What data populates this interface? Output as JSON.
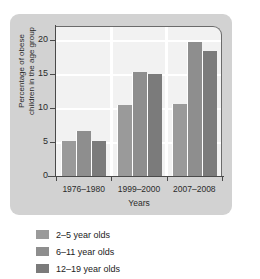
{
  "chart_data": {
    "type": "bar",
    "title": "",
    "xlabel": "Years",
    "ylabel_line1": "Percentage of obese",
    "ylabel_line2": "children in the age group",
    "categories": [
      "1976–1980",
      "1999–2000",
      "2007–2008"
    ],
    "series": [
      {
        "name": "2–5 year olds",
        "values": [
          5.1,
          10.4,
          10.6
        ],
        "color": "#9a9a9a"
      },
      {
        "name": "6–11 year olds",
        "values": [
          6.6,
          15.3,
          19.6
        ],
        "color": "#8e8e8e"
      },
      {
        "name": "12–19 year olds",
        "values": [
          5.1,
          15.0,
          18.4
        ],
        "color": "#7b7b7b"
      }
    ],
    "ylim": [
      0,
      22
    ],
    "yticks": [
      0,
      5,
      10,
      15,
      20
    ],
    "ytick_labels": [
      "0",
      "5",
      "10",
      "15",
      "20"
    ],
    "grid": "horizontal",
    "legend_position": "below"
  },
  "legend": {
    "items": [
      {
        "label": "2–5 year olds",
        "color": "#9a9a9a"
      },
      {
        "label": "6–11 year olds",
        "color": "#8e8e8e"
      },
      {
        "label": "12–19 year olds",
        "color": "#7b7b7b"
      }
    ]
  },
  "colors": {
    "panel": "#d2d2d2",
    "plot_background": "#f2f2f2",
    "gridline": "#ffffff",
    "axis": "#4a4a4a",
    "text": "#2b2b2b"
  }
}
